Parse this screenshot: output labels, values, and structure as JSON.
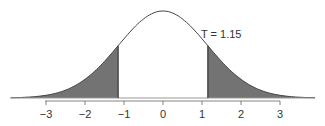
{
  "chart_data": {
    "type": "area",
    "title": "",
    "distribution": "t-distribution (bell curve)",
    "annotation": "T = 1.15",
    "test_statistic": 1.15,
    "shaded_regions": [
      {
        "from": -4.0,
        "to": -1.15,
        "label": "lower tail"
      },
      {
        "from": 1.15,
        "to": 4.0,
        "label": "upper tail"
      }
    ],
    "xticks": [
      -3,
      -2,
      -1,
      0,
      1,
      2,
      3
    ],
    "xtick_labels": [
      "−3",
      "−2",
      "−1",
      "0",
      "1",
      "2",
      "3"
    ],
    "xlim": [
      -4,
      4
    ],
    "xlabel": "",
    "ylabel": "",
    "grid": false,
    "colors": {
      "curve": "#444444",
      "shade": "#737373",
      "axis": "#555555"
    }
  }
}
